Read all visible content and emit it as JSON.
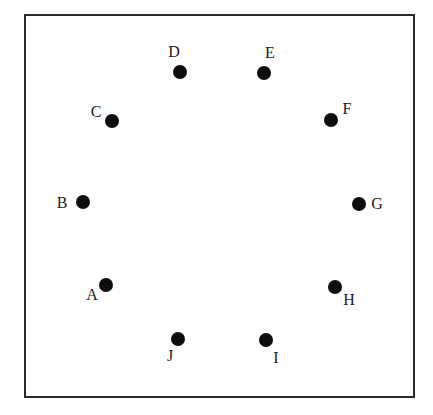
{
  "diagram": {
    "type": "points-in-square",
    "frame": {
      "left": 24,
      "top": 14,
      "right": 413,
      "bottom": 396,
      "stroke": "#2a2a2a"
    },
    "dot_color": "#0d0d0d",
    "points": [
      {
        "id": "A",
        "label": "A",
        "x": 106,
        "y": 285,
        "lx": 92,
        "ly": 295
      },
      {
        "id": "B",
        "label": "B",
        "x": 83,
        "y": 202,
        "lx": 62,
        "ly": 203
      },
      {
        "id": "C",
        "label": "C",
        "x": 112,
        "y": 121,
        "lx": 96,
        "ly": 112
      },
      {
        "id": "D",
        "label": "D",
        "x": 180,
        "y": 72,
        "lx": 174,
        "ly": 52
      },
      {
        "id": "E",
        "label": "E",
        "x": 264,
        "y": 73,
        "lx": 270,
        "ly": 53
      },
      {
        "id": "F",
        "label": "F",
        "x": 331,
        "y": 120,
        "lx": 347,
        "ly": 109
      },
      {
        "id": "G",
        "label": "G",
        "x": 359,
        "y": 204,
        "lx": 377,
        "ly": 204
      },
      {
        "id": "H",
        "label": "H",
        "x": 335,
        "y": 287,
        "lx": 349,
        "ly": 300
      },
      {
        "id": "I",
        "label": "I",
        "x": 266,
        "y": 340,
        "lx": 276,
        "ly": 358
      },
      {
        "id": "J",
        "label": "J",
        "x": 178,
        "y": 339,
        "lx": 170,
        "ly": 356
      }
    ]
  }
}
